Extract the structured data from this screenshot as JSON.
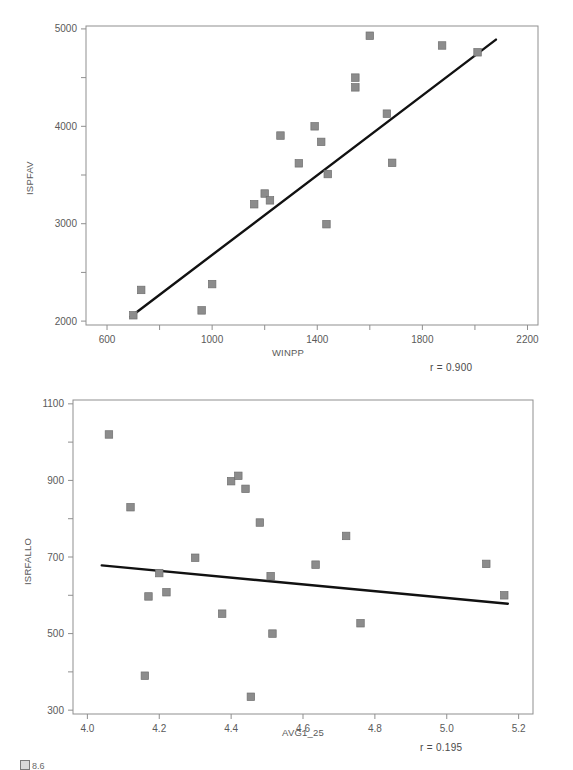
{
  "figure": {
    "caption": "8.6",
    "caption_icon": "figure-box-icon"
  },
  "chart_data": [
    {
      "id": "top",
      "type": "scatter",
      "title": "",
      "xlabel": "WINPP",
      "ylabel": "ISPFAV",
      "xlim": [
        520,
        2240
      ],
      "ylim": [
        1960,
        5030
      ],
      "xticks": [
        600,
        800,
        1000,
        1200,
        1400,
        1600,
        1800,
        2000,
        2200
      ],
      "xticklabels": [
        "600",
        "",
        "1000",
        "",
        "1400",
        "",
        "1800",
        "",
        "2200"
      ],
      "yticks": [
        2000,
        2500,
        3000,
        3500,
        4000,
        4500,
        5000
      ],
      "yticklabels": [
        "2000",
        "",
        "3000",
        "",
        "4000",
        "",
        "5000"
      ],
      "grid": false,
      "annotation": "r = 0.900",
      "correlation": 0.9,
      "marker": "square",
      "marker_color": "#8c8c8c",
      "fit_line": {
        "x0": 690,
        "y0": 2045,
        "x1": 2080,
        "y1": 4890,
        "color": "#111111"
      },
      "points": [
        {
          "x": 700,
          "y": 2060
        },
        {
          "x": 730,
          "y": 2320
        },
        {
          "x": 960,
          "y": 2110
        },
        {
          "x": 1000,
          "y": 2380
        },
        {
          "x": 1160,
          "y": 3200
        },
        {
          "x": 1200,
          "y": 3310
        },
        {
          "x": 1220,
          "y": 3240
        },
        {
          "x": 1260,
          "y": 3905
        },
        {
          "x": 1330,
          "y": 3620
        },
        {
          "x": 1390,
          "y": 4000
        },
        {
          "x": 1415,
          "y": 3840
        },
        {
          "x": 1440,
          "y": 3510
        },
        {
          "x": 1435,
          "y": 2995
        },
        {
          "x": 1545,
          "y": 4500
        },
        {
          "x": 1545,
          "y": 4400
        },
        {
          "x": 1600,
          "y": 4930
        },
        {
          "x": 1665,
          "y": 4130
        },
        {
          "x": 1685,
          "y": 3625
        },
        {
          "x": 1875,
          "y": 4830
        },
        {
          "x": 2010,
          "y": 4760
        }
      ]
    },
    {
      "id": "bottom",
      "type": "scatter",
      "title": "",
      "xlabel": "AVG1_25",
      "ylabel": "ISRFALLO",
      "xlim": [
        3.96,
        5.24
      ],
      "ylim": [
        290,
        1110
      ],
      "xticks": [
        4.0,
        4.2,
        4.4,
        4.6,
        4.8,
        5.0,
        5.2
      ],
      "xticklabels": [
        "4.0",
        "4.2",
        "4.4",
        "4.6",
        "4.8",
        "5.0",
        "5.2"
      ],
      "yticks": [
        300,
        400,
        500,
        600,
        700,
        800,
        900,
        1000,
        1100
      ],
      "yticklabels": [
        "300",
        "",
        "500",
        "",
        "700",
        "",
        "900",
        "",
        "1100"
      ],
      "grid": false,
      "annotation": "r = 0.195",
      "correlation": 0.195,
      "marker": "square",
      "marker_color": "#8c8c8c",
      "fit_line": {
        "x0": 4.04,
        "y0": 678,
        "x1": 5.17,
        "y1": 578,
        "color": "#111111"
      },
      "points": [
        {
          "x": 4.06,
          "y": 1020
        },
        {
          "x": 4.12,
          "y": 830
        },
        {
          "x": 4.16,
          "y": 390
        },
        {
          "x": 4.17,
          "y": 597
        },
        {
          "x": 4.2,
          "y": 658
        },
        {
          "x": 4.22,
          "y": 608
        },
        {
          "x": 4.3,
          "y": 698
        },
        {
          "x": 4.375,
          "y": 552
        },
        {
          "x": 4.4,
          "y": 898
        },
        {
          "x": 4.42,
          "y": 912
        },
        {
          "x": 4.44,
          "y": 878
        },
        {
          "x": 4.455,
          "y": 335
        },
        {
          "x": 4.48,
          "y": 790
        },
        {
          "x": 4.51,
          "y": 650
        },
        {
          "x": 4.515,
          "y": 500
        },
        {
          "x": 4.635,
          "y": 680
        },
        {
          "x": 4.72,
          "y": 755
        },
        {
          "x": 4.76,
          "y": 527
        },
        {
          "x": 5.11,
          "y": 682
        },
        {
          "x": 5.16,
          "y": 600
        }
      ]
    }
  ]
}
